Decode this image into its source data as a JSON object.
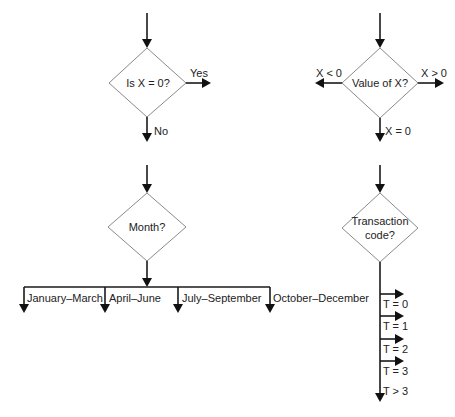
{
  "diagram_1": {
    "decision": "Is X = 0?",
    "branches": {
      "yes": "Yes",
      "no": "No"
    }
  },
  "diagram_2": {
    "decision": "Value of X?",
    "branches": {
      "less": "X < 0",
      "greater": "X > 0",
      "equal": "X = 0"
    }
  },
  "diagram_3": {
    "decision": "Month?",
    "branches": [
      "January–March",
      "April–June",
      "July–September",
      "October–December"
    ]
  },
  "diagram_4": {
    "decision_line1": "Transaction",
    "decision_line2": "code?",
    "branches": [
      "T = 0",
      "T = 1",
      "T = 2",
      "T = 3",
      "T > 3"
    ]
  },
  "colors": {
    "line": "#1a1a1a",
    "diamond_border": "#8a8a8a",
    "background": "#ffffff"
  }
}
